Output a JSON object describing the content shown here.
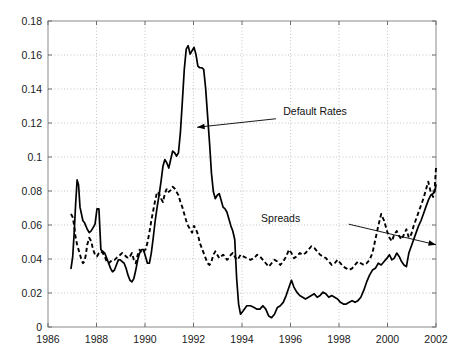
{
  "figure": {
    "background": "#ffffff",
    "width": 470,
    "height": 363
  },
  "chart_data": {
    "type": "line",
    "title": "",
    "subtitle": "",
    "xlabel": "",
    "ylabel": "",
    "xlim": [
      1986,
      2002
    ],
    "ylim": [
      0,
      0.18
    ],
    "grid": true,
    "legend_position": "inline-annotations",
    "xticks": [
      1986,
      1988,
      1990,
      1992,
      1994,
      1996,
      1998,
      2000,
      2002
    ],
    "xtick_labels": [
      "1986",
      "1988",
      "1990",
      "1992",
      "1994",
      "1996",
      "1998",
      "2000",
      "2002"
    ],
    "yticks": [
      0,
      0.02,
      0.04,
      0.06,
      0.08,
      0.1,
      0.12,
      0.14,
      0.16,
      0.18
    ],
    "ytick_labels": [
      "0",
      "0.02",
      "0.04",
      "0.06",
      "0.08",
      "0.1",
      "0.12",
      "0.14",
      "0.16",
      "0.18"
    ],
    "annotations": [
      {
        "text": "Default Rates",
        "text_x": 1995.7,
        "text_y": 0.1245,
        "arrow_from_x": 1995.4,
        "arrow_from_y": 0.1225,
        "arrow_to_x": 1992.15,
        "arrow_to_y": 0.1175,
        "series": "Default Rates"
      },
      {
        "text": "Spreads",
        "text_x": 1996.4,
        "text_y": 0.0615,
        "arrow_from_x": 1998.4,
        "arrow_from_y": 0.0605,
        "arrow_to_x": 2002.0,
        "arrow_to_y": 0.0484,
        "series": "Spreads"
      }
    ],
    "series": [
      {
        "name": "Default Rates",
        "style": "solid",
        "color": "#000000",
        "x": [
          1986.95,
          1987.02,
          1987.08,
          1987.14,
          1987.2,
          1987.26,
          1987.32,
          1987.38,
          1987.44,
          1987.5,
          1987.56,
          1987.62,
          1987.7,
          1987.78,
          1987.86,
          1987.94,
          1988.02,
          1988.1,
          1988.18,
          1988.26,
          1988.34,
          1988.42,
          1988.5,
          1988.58,
          1988.66,
          1988.74,
          1988.82,
          1988.9,
          1988.98,
          1989.06,
          1989.14,
          1989.22,
          1989.3,
          1989.38,
          1989.46,
          1989.54,
          1989.62,
          1989.7,
          1989.78,
          1989.86,
          1989.94,
          1990.02,
          1990.1,
          1990.18,
          1990.26,
          1990.34,
          1990.42,
          1990.5,
          1990.58,
          1990.66,
          1990.74,
          1990.82,
          1990.9,
          1990.98,
          1991.06,
          1991.14,
          1991.22,
          1991.3,
          1991.38,
          1991.46,
          1991.54,
          1991.62,
          1991.7,
          1991.78,
          1991.86,
          1991.94,
          1992.02,
          1992.1,
          1992.18,
          1992.26,
          1992.34,
          1992.42,
          1992.5,
          1992.58,
          1992.66,
          1992.74,
          1992.82,
          1992.9,
          1992.98,
          1993.06,
          1993.14,
          1993.22,
          1993.3,
          1993.38,
          1993.46,
          1993.54,
          1993.62,
          1993.7,
          1993.78,
          1993.86,
          1993.94,
          1994.05,
          1994.2,
          1994.35,
          1994.5,
          1994.62,
          1994.74,
          1994.86,
          1994.98,
          1995.1,
          1995.22,
          1995.34,
          1995.46,
          1995.58,
          1995.7,
          1995.82,
          1995.94,
          1996.04,
          1996.14,
          1996.26,
          1996.38,
          1996.5,
          1996.62,
          1996.74,
          1996.86,
          1996.98,
          1997.1,
          1997.22,
          1997.34,
          1997.46,
          1997.58,
          1997.7,
          1997.82,
          1997.94,
          1998.06,
          1998.18,
          1998.3,
          1998.42,
          1998.54,
          1998.66,
          1998.78,
          1998.9,
          1999.02,
          1999.14,
          1999.26,
          1999.38,
          1999.5,
          1999.62,
          1999.74,
          1999.86,
          1999.98,
          2000.08,
          2000.18,
          2000.28,
          2000.38,
          2000.48,
          2000.58,
          2000.68,
          2000.78,
          2000.88,
          2000.98,
          2001.08,
          2001.18,
          2001.28,
          2001.38,
          2001.48,
          2001.58,
          2001.68,
          2001.78,
          2001.88,
          2001.94,
          2002.0
        ],
        "y": [
          0.0345,
          0.0415,
          0.0555,
          0.0725,
          0.0865,
          0.0835,
          0.0705,
          0.0665,
          0.0625,
          0.0615,
          0.0595,
          0.0575,
          0.0555,
          0.0565,
          0.0585,
          0.0605,
          0.0695,
          0.0695,
          0.0455,
          0.0445,
          0.0435,
          0.0405,
          0.0375,
          0.0345,
          0.0325,
          0.0335,
          0.0365,
          0.0395,
          0.0395,
          0.0385,
          0.0375,
          0.0345,
          0.0305,
          0.0275,
          0.0265,
          0.0285,
          0.0335,
          0.0395,
          0.0435,
          0.0455,
          0.0455,
          0.0415,
          0.0375,
          0.0375,
          0.0435,
          0.0525,
          0.0625,
          0.0705,
          0.0775,
          0.0855,
          0.0945,
          0.0985,
          0.0965,
          0.0935,
          0.0985,
          0.1035,
          0.1025,
          0.1005,
          0.1025,
          0.1145,
          0.1325,
          0.1515,
          0.1635,
          0.1655,
          0.1605,
          0.1625,
          0.1645,
          0.1605,
          0.1535,
          0.1525,
          0.1525,
          0.1515,
          0.1405,
          0.1245,
          0.1085,
          0.0905,
          0.0795,
          0.0755,
          0.0775,
          0.0785,
          0.0745,
          0.0705,
          0.0695,
          0.0675,
          0.0635,
          0.0595,
          0.0565,
          0.0515,
          0.0285,
          0.0135,
          0.0075,
          0.0095,
          0.0125,
          0.0125,
          0.0115,
          0.0105,
          0.0105,
          0.0125,
          0.0105,
          0.0065,
          0.0055,
          0.0075,
          0.0115,
          0.0125,
          0.0145,
          0.0185,
          0.0235,
          0.0275,
          0.0235,
          0.0205,
          0.0185,
          0.0175,
          0.0165,
          0.0175,
          0.0185,
          0.0195,
          0.0175,
          0.0185,
          0.0205,
          0.0195,
          0.0175,
          0.0185,
          0.0175,
          0.0165,
          0.0145,
          0.0135,
          0.0135,
          0.0145,
          0.0155,
          0.0145,
          0.0155,
          0.0175,
          0.0215,
          0.0265,
          0.0305,
          0.0335,
          0.0345,
          0.0375,
          0.0365,
          0.0385,
          0.0405,
          0.0425,
          0.0395,
          0.0405,
          0.0435,
          0.0415,
          0.0385,
          0.0365,
          0.0355,
          0.0435,
          0.0475,
          0.0515,
          0.0555,
          0.0595,
          0.0625,
          0.0665,
          0.0705,
          0.0745,
          0.0775,
          0.0785,
          0.0795,
          0.0835
        ]
      },
      {
        "name": "Spreads",
        "style": "dashed",
        "color": "#000000",
        "x": [
          1986.95,
          1987.02,
          1987.08,
          1987.14,
          1987.2,
          1987.26,
          1987.32,
          1987.38,
          1987.44,
          1987.5,
          1987.56,
          1987.62,
          1987.7,
          1987.78,
          1987.86,
          1987.94,
          1988.02,
          1988.1,
          1988.18,
          1988.26,
          1988.34,
          1988.42,
          1988.5,
          1988.58,
          1988.66,
          1988.74,
          1988.82,
          1988.9,
          1988.98,
          1989.06,
          1989.14,
          1989.22,
          1989.3,
          1989.38,
          1989.46,
          1989.54,
          1989.62,
          1989.7,
          1989.78,
          1989.86,
          1989.94,
          1990.02,
          1990.1,
          1990.18,
          1990.26,
          1990.34,
          1990.42,
          1990.5,
          1990.58,
          1990.66,
          1990.74,
          1990.82,
          1990.9,
          1990.98,
          1991.06,
          1991.14,
          1991.22,
          1991.3,
          1991.38,
          1991.46,
          1991.54,
          1991.62,
          1991.7,
          1991.78,
          1991.86,
          1991.94,
          1992.02,
          1992.1,
          1992.18,
          1992.26,
          1992.34,
          1992.42,
          1992.5,
          1992.58,
          1992.66,
          1992.74,
          1992.82,
          1992.9,
          1992.98,
          1993.06,
          1993.14,
          1993.22,
          1993.3,
          1993.38,
          1993.46,
          1993.54,
          1993.62,
          1993.7,
          1993.78,
          1993.86,
          1993.94,
          1994.05,
          1994.2,
          1994.35,
          1994.5,
          1994.62,
          1994.74,
          1994.86,
          1994.98,
          1995.1,
          1995.22,
          1995.34,
          1995.46,
          1995.58,
          1995.7,
          1995.82,
          1995.94,
          1996.04,
          1996.14,
          1996.26,
          1996.38,
          1996.5,
          1996.62,
          1996.74,
          1996.86,
          1996.98,
          1997.1,
          1997.22,
          1997.34,
          1997.46,
          1997.58,
          1997.7,
          1997.82,
          1997.94,
          1998.06,
          1998.18,
          1998.3,
          1998.42,
          1998.54,
          1998.66,
          1998.78,
          1998.9,
          1999.02,
          1999.14,
          1999.26,
          1999.38,
          1999.5,
          1999.62,
          1999.74,
          1999.86,
          1999.98,
          2000.08,
          2000.18,
          2000.28,
          2000.38,
          2000.48,
          2000.58,
          2000.68,
          2000.78,
          2000.88,
          2000.98,
          2001.08,
          2001.18,
          2001.28,
          2001.38,
          2001.48,
          2001.58,
          2001.68,
          2001.78,
          2001.88,
          2001.94,
          2002.0
        ],
        "y": [
          0.0665,
          0.0645,
          0.0595,
          0.0525,
          0.0485,
          0.0455,
          0.0425,
          0.0395,
          0.0375,
          0.0385,
          0.0425,
          0.0485,
          0.0525,
          0.0505,
          0.0455,
          0.0425,
          0.0415,
          0.0435,
          0.0445,
          0.0435,
          0.0415,
          0.0385,
          0.0375,
          0.0385,
          0.0395,
          0.0395,
          0.0405,
          0.0415,
          0.0425,
          0.0435,
          0.0425,
          0.0415,
          0.0405,
          0.0415,
          0.0435,
          0.0395,
          0.0375,
          0.0425,
          0.0455,
          0.0435,
          0.0445,
          0.0455,
          0.0495,
          0.0555,
          0.0625,
          0.0685,
          0.0745,
          0.0795,
          0.0785,
          0.0755,
          0.0735,
          0.0785,
          0.0815,
          0.0795,
          0.0805,
          0.0825,
          0.0815,
          0.0795,
          0.0775,
          0.0735,
          0.0705,
          0.0665,
          0.0625,
          0.0595,
          0.0575,
          0.0555,
          0.0595,
          0.0575,
          0.0545,
          0.0495,
          0.0465,
          0.0435,
          0.0405,
          0.0375,
          0.0365,
          0.0385,
          0.0425,
          0.0445,
          0.0425,
          0.0405,
          0.0415,
          0.0425,
          0.0415,
          0.0395,
          0.0405,
          0.0425,
          0.0435,
          0.0415,
          0.0395,
          0.0405,
          0.0425,
          0.0415,
          0.0405,
          0.0395,
          0.0405,
          0.0425,
          0.0415,
          0.0395,
          0.0375,
          0.0355,
          0.0375,
          0.0395,
          0.0385,
          0.0365,
          0.0385,
          0.0415,
          0.0455,
          0.0435,
          0.0405,
          0.0415,
          0.0435,
          0.0425,
          0.0435,
          0.0455,
          0.0475,
          0.0465,
          0.0445,
          0.0425,
          0.0415,
          0.0405,
          0.0385,
          0.0365,
          0.0375,
          0.0395,
          0.0375,
          0.0355,
          0.0345,
          0.0335,
          0.0345,
          0.0365,
          0.0385,
          0.0375,
          0.0365,
          0.0375,
          0.0395,
          0.0435,
          0.0515,
          0.0595,
          0.0665,
          0.0625,
          0.0565,
          0.0525,
          0.0505,
          0.0545,
          0.0565,
          0.0535,
          0.0515,
          0.0545,
          0.0575,
          0.0525,
          0.0545,
          0.0595,
          0.0635,
          0.0675,
          0.0715,
          0.0755,
          0.0805,
          0.0855,
          0.0795,
          0.0765,
          0.0805,
          0.0935
        ]
      }
    ]
  }
}
